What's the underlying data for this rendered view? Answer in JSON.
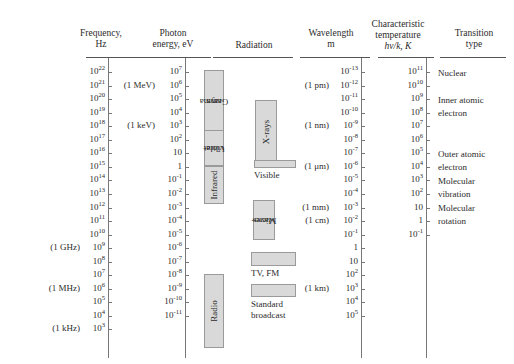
{
  "figure": {
    "background": "#ffffff",
    "band_fill": "#d9d9d9",
    "band_stroke": "#9a9a9a"
  },
  "columns": {
    "frequency": {
      "header_line1": "Frequency,",
      "header_line2": "Hz"
    },
    "photon_energy": {
      "header_line1": "Photon",
      "header_line2": "energy, eV"
    },
    "radiation": {
      "header_line1": "Radiation",
      "header_line2": ""
    },
    "wavelength": {
      "header_line1": "Wavelength",
      "header_line2": "m"
    },
    "temperature": {
      "header_line1": "Characteristic",
      "header_line2": "temperature",
      "header_line3": "hν/k, K"
    },
    "transition": {
      "header_line1": "Transition",
      "header_line2": "type"
    }
  },
  "chart_data": {
    "type": "table",
    "xlabel": "",
    "ylabel": "",
    "grid": false,
    "legend": "none",
    "axes": [
      {
        "name": "frequency",
        "header": "Frequency, Hz",
        "unit": "Hz",
        "scale": "log10",
        "range": [
          3,
          22
        ],
        "ticks": [
          "10^22",
          "10^21",
          "10^20",
          "10^19",
          "10^18",
          "10^17",
          "10^16",
          "10^15",
          "10^14",
          "10^13",
          "10^12",
          "10^11",
          "10^10",
          "10^9",
          "10^8",
          "10^7",
          "10^6",
          "10^5",
          "10^4",
          "10^3"
        ],
        "tick_exponents": [
          22,
          21,
          20,
          19,
          18,
          17,
          16,
          15,
          14,
          13,
          12,
          11,
          10,
          9,
          8,
          7,
          6,
          5,
          4,
          3
        ],
        "annotations": [
          {
            "at_exponent": 9,
            "text": "(1 GHz)"
          },
          {
            "at_exponent": 6,
            "text": "(1 MHz)"
          },
          {
            "at_exponent": 3,
            "text": "(1 kHz)"
          }
        ]
      },
      {
        "name": "photon_energy",
        "header": "Photon energy, eV",
        "unit": "eV",
        "scale": "log10",
        "range": [
          -11,
          7
        ],
        "tick_exponents": [
          7,
          6,
          5,
          4,
          3,
          2,
          1,
          0,
          -1,
          -2,
          -3,
          -4,
          -5,
          -6,
          -7,
          -8,
          -9,
          -10,
          -11
        ],
        "annotations": [
          {
            "at_exponent": 6,
            "text": "(1 MeV)"
          },
          {
            "at_exponent": 3,
            "text": "(1 keV)"
          }
        ]
      },
      {
        "name": "wavelength",
        "header": "Wavelength, m",
        "unit": "m",
        "scale": "log10",
        "range": [
          -13,
          5
        ],
        "tick_exponents": [
          -13,
          -12,
          -11,
          -10,
          -9,
          -8,
          -7,
          -6,
          -5,
          -4,
          -3,
          -2,
          -1,
          0,
          1,
          2,
          3,
          4,
          5
        ],
        "annotations": [
          {
            "at_exponent": -12,
            "text": "(1 pm)"
          },
          {
            "at_exponent": -9,
            "text": "(1 nm)"
          },
          {
            "at_exponent": -6,
            "text": "(1 μm)"
          },
          {
            "at_exponent": -3,
            "text": "(1 mm)"
          },
          {
            "at_exponent": -2,
            "text": "(1 cm)"
          },
          {
            "at_exponent": 3,
            "text": "(1 km)"
          }
        ]
      },
      {
        "name": "characteristic_temperature",
        "header": "Characteristic temperature hν/k, K",
        "unit": "K",
        "scale": "log10",
        "range": [
          -1,
          11
        ],
        "tick_exponents": [
          11,
          10,
          9,
          8,
          7,
          6,
          5,
          4,
          3,
          2,
          1,
          0,
          -1
        ],
        "annotations": []
      }
    ],
    "bands": [
      {
        "name": "Gamma rays",
        "label_lines": [
          "Gamma",
          "rays"
        ],
        "orientation": "vertical",
        "freq_exponent_range": [
          17.6,
          22.3
        ]
      },
      {
        "name": "X-rays",
        "label_lines": [
          "X-rays"
        ],
        "orientation": "vertical",
        "freq_exponent_range": [
          15.4,
          20.2
        ]
      },
      {
        "name": "Ultraviolet",
        "label_lines": [
          "Ultra-",
          "violet"
        ],
        "orientation": "vertical",
        "freq_exponent_range": [
          14.6,
          17.2
        ]
      },
      {
        "name": "Visible",
        "label_lines": [
          "Visible"
        ],
        "orientation": "horizontal-bar",
        "freq_exponent_range": [
          14.3,
          14.9
        ]
      },
      {
        "name": "Infrared",
        "label_lines": [
          "Infrared"
        ],
        "orientation": "vertical",
        "freq_exponent_range": [
          11.8,
          14.4
        ]
      },
      {
        "name": "Microwaves",
        "label_lines": [
          "Micro-",
          "waves"
        ],
        "orientation": "vertical",
        "freq_exponent_range": [
          9.3,
          12.2
        ]
      },
      {
        "name": "TV, FM",
        "label_lines": [
          "TV, FM"
        ],
        "orientation": "horizontal-bar",
        "freq_exponent_range": [
          7.6,
          9.0
        ]
      },
      {
        "name": "Standard broadcast",
        "label_lines": [
          "Standard",
          "broadcast"
        ],
        "orientation": "horizontal-bar",
        "freq_exponent_range": [
          5.7,
          6.9
        ]
      },
      {
        "name": "Radio",
        "label_lines": [
          "Radio"
        ],
        "orientation": "vertical",
        "freq_exponent_range": [
          3.2,
          8.6
        ]
      }
    ],
    "transitions": [
      {
        "label": "Nuclear",
        "lines": [
          "Nuclear"
        ],
        "at_temperature_exponent": 11
      },
      {
        "label": "Inner atomic electron",
        "lines": [
          "Inner atomic",
          "electron"
        ],
        "at_temperature_exponent": 9
      },
      {
        "label": "Outer atomic electron",
        "lines": [
          "Outer atomic",
          "electron"
        ],
        "at_temperature_exponent": 5
      },
      {
        "label": "Molecular vibration",
        "lines": [
          "Molecular",
          "vibration"
        ],
        "at_temperature_exponent": 3
      },
      {
        "label": "Molecular rotation",
        "lines": [
          "Molecular",
          "rotation"
        ],
        "at_temperature_exponent": 1
      }
    ]
  },
  "transition_labels": {
    "nuclear": "Nuclear",
    "inner_atomic_1": "Inner atomic",
    "inner_atomic_2": "electron",
    "outer_atomic_1": "Outer atomic",
    "outer_atomic_2": "electron",
    "molecular_vib_1": "Molecular",
    "molecular_vib_2": "vibration",
    "molecular_rot_1": "Molecular",
    "molecular_rot_2": "rotation"
  },
  "band_labels": {
    "gamma_1": "Gamma",
    "gamma_2": "rays",
    "xrays": "X-rays",
    "uv_1": "Ultra-",
    "uv_2": "violet",
    "visible": "Visible",
    "infrared": "Infrared",
    "micro_1": "Micro-",
    "micro_2": "waves",
    "tvfm": "TV, FM",
    "std_1": "Standard",
    "std_2": "broadcast",
    "radio": "Radio"
  }
}
